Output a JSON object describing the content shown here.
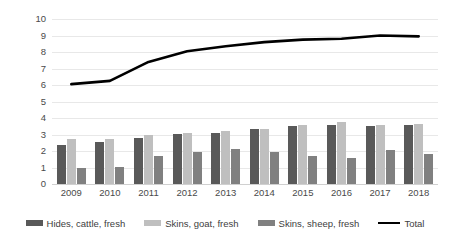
{
  "chart_data": {
    "type": "bar",
    "title": "",
    "subtitle": "",
    "xlabel": "",
    "ylabel": "Million heads slaughtered",
    "ylim": [
      0,
      10
    ],
    "ytick_step": 1,
    "yticks": [
      "10",
      "9",
      "8",
      "7",
      "6",
      "5",
      "4",
      "3",
      "2",
      "1",
      "0"
    ],
    "grid": true,
    "legend_position": "bottom",
    "categories": [
      "2009",
      "2010",
      "2011",
      "2012",
      "2013",
      "2014",
      "2015",
      "2016",
      "2017",
      "2018"
    ],
    "series": [
      {
        "name": "Hides, cattle, fresh",
        "kind": "bar",
        "color": "#595959",
        "values": [
          2.35,
          2.55,
          2.8,
          3.05,
          3.1,
          3.35,
          3.5,
          3.55,
          3.5,
          3.6
        ]
      },
      {
        "name": "Skins, goat, fresh",
        "kind": "bar",
        "color": "#bfbfbf",
        "values": [
          2.7,
          2.72,
          3.0,
          3.1,
          3.2,
          3.35,
          3.6,
          3.75,
          3.6,
          3.65
        ]
      },
      {
        "name": "Skins, sheep, fresh",
        "kind": "bar",
        "color": "#808080",
        "values": [
          1.0,
          1.02,
          1.72,
          1.92,
          2.12,
          1.95,
          1.72,
          1.58,
          2.05,
          1.8
        ]
      },
      {
        "name": "Total",
        "kind": "line",
        "color": "#000000",
        "values": [
          6.05,
          6.25,
          7.4,
          8.05,
          8.35,
          8.6,
          8.75,
          8.8,
          9.0,
          8.95
        ]
      }
    ]
  },
  "axis": {
    "y_title": "Million heads slaughtered"
  },
  "legend": {
    "items": [
      {
        "label": "Hides, cattle, fresh",
        "style": "bar",
        "color": "#595959"
      },
      {
        "label": "Skins, goat, fresh",
        "style": "bar",
        "color": "#bfbfbf"
      },
      {
        "label": "Skins, sheep, fresh",
        "style": "bar",
        "color": "#808080"
      },
      {
        "label": "Total",
        "style": "line",
        "color": "#000000"
      }
    ]
  }
}
